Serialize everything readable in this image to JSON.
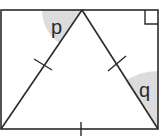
{
  "diagram": {
    "type": "geometry",
    "colors": {
      "stroke": "#2a2a2a",
      "shade": "#dcdcdc",
      "background": "#ffffff"
    },
    "rectangle": {
      "corners": [
        [
          1,
          10
        ],
        [
          158,
          10
        ],
        [
          158,
          129
        ],
        [
          1,
          129
        ]
      ],
      "right_angle_marker": "top-right"
    },
    "triangle": {
      "vertices": [
        [
          82,
          10
        ],
        [
          1,
          129
        ],
        [
          158,
          129
        ]
      ],
      "equal_sides_tick_marks": 3
    },
    "angles": [
      {
        "label": "p",
        "location": "apex, between rectangle top edge and triangle left side"
      },
      {
        "label": "q",
        "location": "bottom-right, between triangle right side and rectangle right edge"
      }
    ]
  },
  "labels": {
    "p": "p",
    "q": "q"
  }
}
